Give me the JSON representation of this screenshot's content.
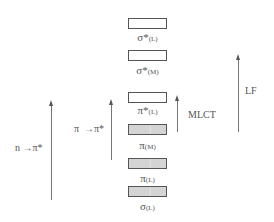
{
  "diagram": {
    "type": "molecular-orbital-energy-level-diagram",
    "levels": [
      {
        "symbol": "σ*",
        "sub": "(L)",
        "filled": false
      },
      {
        "symbol": "σ*",
        "sub": "(M)",
        "filled": false
      },
      {
        "symbol": "π*",
        "sub": "(L)",
        "filled": false
      },
      {
        "symbol": "π",
        "sub": "(M)",
        "filled": true
      },
      {
        "symbol": "π",
        "sub": "(L)",
        "filled": true
      },
      {
        "symbol": "σ",
        "sub": "(L)",
        "filled": true
      }
    ],
    "transitions": [
      {
        "label": "n → π*",
        "from": "n",
        "to": "π*(L)"
      },
      {
        "label": "π → π*",
        "from": "π(L)",
        "to": "π*(L)"
      },
      {
        "label": "MLCT",
        "from": "π(M)",
        "to": "π*(L)"
      },
      {
        "label": "LF",
        "from": "π(M)",
        "to": "σ*(M)"
      }
    ],
    "labels": {
      "n_pi": "n",
      "n_pi_arrow": "→",
      "n_pi_target": "π*",
      "pi_pi": "π",
      "pi_pi_arrow": "→",
      "pi_pi_target": "π*",
      "mlct": "MLCT",
      "lf": "LF"
    }
  }
}
